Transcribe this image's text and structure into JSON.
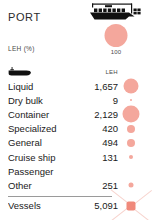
{
  "header": {
    "title": "PORT",
    "unit_label": "LEH (%)",
    "legend": {
      "icon": "container-ship-icon",
      "bubble_value": "100",
      "bubble_color": "#f4a79c"
    }
  },
  "table": {
    "columns": {
      "category_icon": "ship-icon",
      "value_header": "LEH"
    },
    "rows": [
      {
        "label": "Liquid",
        "value": "1,657",
        "bubble_px": 15
      },
      {
        "label": "Dry bulk",
        "value": "9",
        "bubble_px": 2
      },
      {
        "label": "Container",
        "value": "2,129",
        "bubble_px": 17
      },
      {
        "label": "Specialized",
        "value": "420",
        "bubble_px": 8
      },
      {
        "label": "General",
        "value": "494",
        "bubble_px": 8
      },
      {
        "label": "Cruise ship",
        "value": "131",
        "bubble_px": 4
      },
      {
        "label": "Passenger",
        "value": "",
        "bubble_px": 0
      },
      {
        "label": "Other",
        "value": "251",
        "bubble_px": 5
      }
    ],
    "total": {
      "label": "Vessels",
      "value": "5,091",
      "marker": "clipped-bubble-marker"
    }
  },
  "chart_data": {
    "type": "bar",
    "title": "PORT",
    "xlabel": "",
    "ylabel": "LEH (%)",
    "categories": [
      "Liquid",
      "Dry bulk",
      "Container",
      "Specialized",
      "General",
      "Cruise ship",
      "Passenger",
      "Other"
    ],
    "values": [
      1657,
      9,
      2129,
      420,
      494,
      131,
      null,
      251
    ],
    "total": 5091,
    "legend_reference_value": 100,
    "grid": false
  }
}
